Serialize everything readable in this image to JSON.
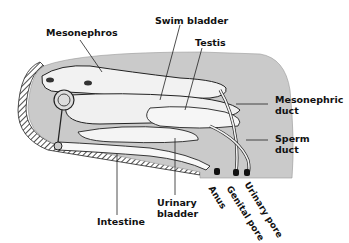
{
  "figure": {
    "labels": {
      "mesonephros": "Mesonephros",
      "swim_bladder": "Swim bladder",
      "testis": "Testis",
      "mesonephric_duct_1": "Mesonephric",
      "mesonephric_duct_2": "duct",
      "sperm_duct_1": "Sperm",
      "sperm_duct_2": "duct",
      "intestine": "Intestine",
      "urinary_bladder_1": "Urinary",
      "urinary_bladder_2": "bladder",
      "anus": "Anus",
      "genital_pore": "Genital pore",
      "urinary_pore": "Urinary pore"
    },
    "colors": {
      "body_cavity": "#c8c8c8",
      "organ": "#f2f2f2",
      "outline": "#222222",
      "background": "#ffffff"
    }
  }
}
